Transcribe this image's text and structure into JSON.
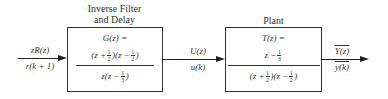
{
  "diagram": {
    "type": "block-diagram",
    "input": {
      "top_label": "zR(z)",
      "bottom_label": "r(k + 1)"
    },
    "block_g": {
      "title_line1": "Inverse Filter",
      "title_line2": "and Delay",
      "name": "G(z) =",
      "numerator": [
        {
          "var": "(z +",
          "num": "1",
          "den": "2",
          "close": ")"
        },
        {
          "var": "(z −",
          "num": "1",
          "den": "2",
          "close": ")"
        }
      ],
      "denominator": {
        "prefix": "z(z −",
        "num": "1",
        "den": "3",
        "close": ")"
      }
    },
    "middle": {
      "top_label": "U(z)",
      "bottom_label": "u(k)"
    },
    "block_t": {
      "title": "Plant",
      "name": "T(z) =",
      "numerator": {
        "prefix": "z −",
        "num": "1",
        "den": "3",
        "close": ""
      },
      "denominator": [
        {
          "var": "(z +",
          "num": "1",
          "den": "2",
          "close": ")"
        },
        {
          "var": "(z −",
          "num": "1",
          "den": "2",
          "close": ")"
        }
      ]
    },
    "output": {
      "top_label": "Y(z)",
      "bottom_label": "y(k)"
    }
  }
}
